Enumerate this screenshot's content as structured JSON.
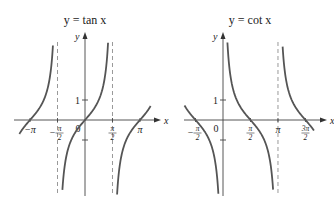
{
  "chart_data": [
    {
      "type": "line",
      "title": "y = tan x",
      "function": "tan",
      "xlabel": "x",
      "ylabel": "y",
      "xlim": [
        -3.7,
        3.9
      ],
      "ylim": [
        -7.2,
        6.5
      ],
      "x_ticks": [
        {
          "value": -3.14159,
          "label": "−π",
          "kind": "plain"
        },
        {
          "value": -1.5708,
          "label": "π/2",
          "sign": "−",
          "kind": "frac"
        },
        {
          "value": 0,
          "label": "0",
          "kind": "num"
        },
        {
          "value": 1.5708,
          "label": "π/2",
          "sign": "",
          "kind": "frac"
        },
        {
          "value": 3.14159,
          "label": "π",
          "kind": "plain"
        }
      ],
      "y_ticks": [
        {
          "value": 1,
          "label": "1"
        }
      ],
      "asymptotes": [
        -1.5708,
        1.5708
      ],
      "branches": [
        [
          -3.75,
          -1.62
        ],
        [
          -1.52,
          1.52
        ],
        [
          1.62,
          3.75
        ]
      ],
      "line_color": "#555555",
      "asymptote_color": "#999999"
    },
    {
      "type": "line",
      "title": "y = cot x",
      "function": "cot",
      "xlabel": "x",
      "ylabel": "y",
      "xlim": [
        -2.3,
        5.3
      ],
      "ylim": [
        -7.2,
        6.5
      ],
      "x_ticks": [
        {
          "value": -1.5708,
          "label": "π/2",
          "sign": "−",
          "kind": "frac"
        },
        {
          "value": 0,
          "label": "0",
          "kind": "num"
        },
        {
          "value": 1.5708,
          "label": "π/2",
          "sign": "",
          "kind": "frac"
        },
        {
          "value": 3.14159,
          "label": "π",
          "kind": "plain"
        },
        {
          "value": 4.7124,
          "label": "3π/2",
          "sign": "",
          "kind": "frac"
        }
      ],
      "y_ticks": [
        {
          "value": 1,
          "label": "1"
        }
      ],
      "asymptotes": [
        3.14159
      ],
      "branches": [
        [
          -2.2,
          -0.05
        ],
        [
          0.05,
          3.09
        ],
        [
          3.19,
          5.2
        ]
      ],
      "line_color": "#555555",
      "asymptote_color": "#999999"
    }
  ]
}
